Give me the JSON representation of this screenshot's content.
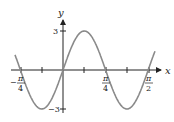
{
  "chart_data": {
    "type": "line",
    "title": "",
    "function": "y = 3 sin(4x)",
    "xlabel": "x",
    "ylabel": "y",
    "xlim": [
      -0.85,
      1.75
    ],
    "ylim": [
      -3,
      3
    ],
    "x_ticks": [
      "-π/4",
      "-π/8",
      "0",
      "π/8",
      "π/4",
      "3π/8",
      "π/2"
    ],
    "x_tick_labels_shown": [
      {
        "num": "π",
        "den": "4",
        "sign": "−"
      },
      {
        "num": "π",
        "den": "4",
        "sign": ""
      },
      {
        "num": "π",
        "den": "2",
        "sign": ""
      }
    ],
    "y_tick_labels": [
      "3",
      "−3"
    ],
    "series": [
      {
        "name": "3sin(4x)",
        "color": "#8a8a8a",
        "x": [
          -0.9,
          -0.785,
          -0.393,
          0,
          0.393,
          0.785,
          1.178,
          1.571,
          1.67
        ],
        "y": [
          1.0,
          0,
          -3,
          0,
          3,
          0,
          -3,
          0,
          1.1
        ]
      }
    ],
    "grid": false,
    "legend": "none"
  },
  "axes": {
    "x_label": "x",
    "y_label": "y",
    "y_max_label": "3",
    "y_min_label": "−3"
  },
  "labels": {
    "neg_pi4": {
      "sign": "−",
      "num": "π",
      "den": "4"
    },
    "pi4": {
      "num": "π",
      "den": "4"
    },
    "pi2": {
      "num": "π",
      "den": "2"
    }
  }
}
